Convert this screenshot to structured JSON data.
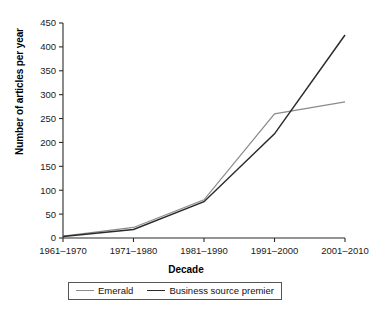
{
  "chart_data": {
    "type": "line",
    "title": "",
    "xlabel": "Decade",
    "ylabel": "Number of articles per year",
    "categories": [
      "1961–1970",
      "1971–1980",
      "1981–1990",
      "1991–2000",
      "2001–2010"
    ],
    "ylim": [
      0,
      450
    ],
    "yticks": [
      0,
      50,
      100,
      150,
      200,
      250,
      300,
      350,
      400,
      450
    ],
    "grid": false,
    "legend_position": "bottom",
    "series": [
      {
        "name": "Emerald",
        "color": "#8c8c8c",
        "values": [
          4,
          22,
          80,
          260,
          285
        ]
      },
      {
        "name": "Business source premier",
        "color": "#2b2b2b",
        "values": [
          3,
          18,
          76,
          218,
          425
        ]
      }
    ]
  },
  "axes": {
    "y_title": "Number of articles per year",
    "x_title": "Decade"
  },
  "legend": {
    "items": [
      {
        "label": "Emerald",
        "color": "#8c8c8c"
      },
      {
        "label": "Business source premier",
        "color": "#2b2b2b"
      }
    ]
  },
  "caption": {
    "text": ""
  }
}
